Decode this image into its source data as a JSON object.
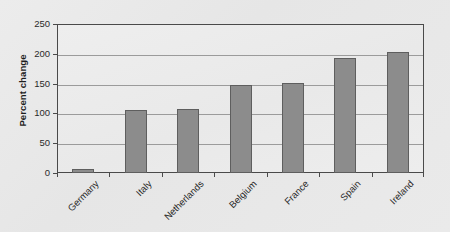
{
  "chart_data": {
    "type": "bar",
    "title": "",
    "subtitle": "",
    "xlabel": "",
    "ylabel": "Percent change",
    "categories": [
      "Germany",
      "Italy",
      "Netherlands",
      "Belgium",
      "France",
      "Spain",
      "Ireland"
    ],
    "values": [
      7,
      105,
      107,
      148,
      151,
      193,
      203
    ],
    "series": [
      {
        "name": "Percent change",
        "values": [
          7,
          105,
          107,
          148,
          151,
          193,
          203
        ]
      }
    ],
    "ylim": [
      0,
      250
    ],
    "ytick_labels": [
      "0",
      "50",
      "100",
      "150",
      "200",
      "250"
    ],
    "ytick_values": [
      0,
      50,
      100,
      150,
      200,
      250
    ],
    "grid": "horizontal",
    "legend": "none",
    "bar_color": "#8c8c8c",
    "bar_border_color": "#5e5e5e",
    "gridline_color": "#9b9b9b",
    "axis_color": "#4a4a4a",
    "background_color": "#e9e9e9",
    "plot_background_color": "#ededed",
    "annotations": []
  }
}
